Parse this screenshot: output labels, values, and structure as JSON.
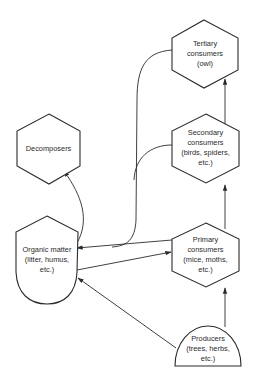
{
  "diagram": {
    "type": "food-web",
    "nodes": [
      {
        "id": "tertiary",
        "shape": "hexagon",
        "lines": [
          "Tertiary",
          "consumers",
          "(owl)"
        ]
      },
      {
        "id": "secondary",
        "shape": "hexagon",
        "lines": [
          "Secondary",
          "consumers",
          "(birds, spiders,",
          "etc.)"
        ]
      },
      {
        "id": "primary",
        "shape": "hexagon",
        "lines": [
          "Primary",
          "consumers",
          "(mice, moths,",
          "etc.)"
        ]
      },
      {
        "id": "producers",
        "shape": "semicircle",
        "lines": [
          "Producers",
          "(trees, herbs,",
          "etc.)"
        ]
      },
      {
        "id": "decomposers",
        "shape": "hexagon",
        "lines": [
          "Decomposers"
        ]
      },
      {
        "id": "organic",
        "shape": "shield",
        "lines": [
          "Organic matter",
          "(litter, humus,",
          "etc.)"
        ]
      }
    ],
    "edges": [
      {
        "from": "producers",
        "to": "primary"
      },
      {
        "from": "primary",
        "to": "secondary"
      },
      {
        "from": "secondary",
        "to": "tertiary"
      },
      {
        "from": "tertiary",
        "to": "organic"
      },
      {
        "from": "secondary",
        "to": "organic"
      },
      {
        "from": "primary",
        "to": "organic"
      },
      {
        "from": "organic",
        "to": "primary"
      },
      {
        "from": "producers",
        "to": "organic"
      },
      {
        "from": "organic",
        "to": "decomposers"
      }
    ],
    "colors": {
      "stroke": "#2a2a2a",
      "fill": "#ffffff",
      "background": "#ffffff"
    }
  }
}
